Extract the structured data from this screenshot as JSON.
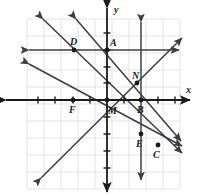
{
  "figure": {
    "kind": "coordinate-plane-with-lines",
    "background_color": "#ffffff",
    "grid_color": "#dcdce4",
    "axis_color": "#1a1a1a",
    "line_color": "#3c3c46",
    "point_color": "#1a1a1a",
    "grid": {
      "left": 27,
      "right": 180,
      "top": 19,
      "bottom": 189,
      "spacing": 17,
      "origin_x": 107,
      "origin_y": 100
    }
  },
  "axes": {
    "x_label": "x",
    "y_label": "y",
    "x_label_pos": {
      "x": 186,
      "y": 85
    },
    "y_label_pos": {
      "x": 114,
      "y": 5
    }
  },
  "points": [
    {
      "id": "A",
      "label": "A",
      "x": 107,
      "y": 50,
      "label_x": 110,
      "label_y": 38,
      "dot": true
    },
    {
      "id": "B",
      "label": "B",
      "x": 141,
      "y": 100,
      "label_x": 137,
      "label_y": 105,
      "dot": true
    },
    {
      "id": "C",
      "label": "C",
      "x": 158,
      "y": 145,
      "label_x": 153,
      "label_y": 150,
      "dot": true
    },
    {
      "id": "D",
      "label": "D",
      "x": 74,
      "y": 50,
      "label_x": 70,
      "label_y": 37,
      "dot": true
    },
    {
      "id": "E",
      "label": "E",
      "x": 141,
      "y": 134,
      "label_x": 136,
      "label_y": 139,
      "dot": true
    },
    {
      "id": "F",
      "label": "F",
      "x": 73,
      "y": 100,
      "label_x": 69,
      "label_y": 105,
      "dot": true
    },
    {
      "id": "M",
      "label": "M",
      "x": 107,
      "y": 100,
      "label_x": 108,
      "label_y": 106,
      "dot": true
    },
    {
      "id": "N",
      "label": "N",
      "x": 137,
      "y": 83,
      "label_x": 132,
      "label_y": 71,
      "dot": true
    }
  ],
  "lines": [
    {
      "id": "line-horizontal-through-D-A",
      "x1": 29,
      "y1": 50,
      "x2": 179,
      "y2": 50
    },
    {
      "id": "line-vertical-through-B-E",
      "x1": 141,
      "y1": 22,
      "x2": 141,
      "y2": 180
    },
    {
      "id": "line-up-right-through-M-N",
      "x1": 41,
      "y1": 178,
      "x2": 182,
      "y2": 38
    },
    {
      "id": "line-down-right-through-A-M-E",
      "x1": 76,
      "y1": 19,
      "x2": 181,
      "y2": 141
    },
    {
      "id": "line-down-right-through-D-B",
      "x1": 43,
      "y1": 19,
      "x2": 182,
      "y2": 153
    },
    {
      "id": "line-down-right-shallow-through-F",
      "x1": 29,
      "y1": 64,
      "x2": 182,
      "y2": 146
    }
  ],
  "x_ticks": [
    {
      "x": 38
    },
    {
      "x": 55
    },
    {
      "x": 73
    },
    {
      "x": 90
    },
    {
      "x": 124
    },
    {
      "x": 158
    },
    {
      "x": 175
    }
  ],
  "y_ticks": [
    {
      "y": 33
    },
    {
      "y": 50
    },
    {
      "y": 67
    },
    {
      "y": 83
    },
    {
      "y": 117
    },
    {
      "y": 134
    },
    {
      "y": 151
    },
    {
      "y": 168
    }
  ],
  "grid_vertical_x": [
    27,
    44,
    61,
    78,
    95,
    112,
    129,
    146,
    163,
    180
  ],
  "grid_horizontal_y": [
    19,
    36,
    53,
    70,
    87,
    104,
    121,
    138,
    155,
    172,
    189
  ]
}
